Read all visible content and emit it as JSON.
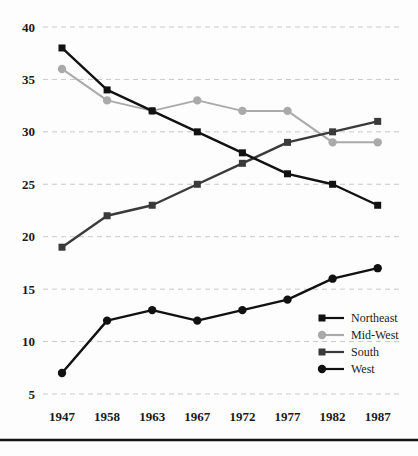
{
  "chart_data": {
    "type": "line",
    "title": "",
    "subtitle": "",
    "xlabel": "",
    "ylabel": "",
    "categories": [
      "1947",
      "1958",
      "1963",
      "1967",
      "1972",
      "1977",
      "1982",
      "1987"
    ],
    "ylim": [
      5,
      40
    ],
    "ytick_labels": [
      "5",
      "10",
      "15",
      "20",
      "25",
      "30",
      "35",
      "40"
    ],
    "ytick_values": [
      5,
      10,
      15,
      20,
      25,
      30,
      35,
      40
    ],
    "grid": "horizontal-dashed",
    "legend_position": "bottom-right-inside",
    "series": [
      {
        "name": "Northeast",
        "color": "#111111",
        "marker": "square",
        "values": [
          38,
          34,
          32,
          30,
          28,
          26,
          25,
          23
        ]
      },
      {
        "name": "Mid-West",
        "color": "#aaaaaa",
        "marker": "circle",
        "values": [
          36,
          33,
          32,
          33,
          32,
          32,
          29,
          29
        ]
      },
      {
        "name": "South",
        "color": "#3a3a3a",
        "marker": "square",
        "values": [
          19,
          22,
          23,
          25,
          27,
          29,
          30,
          31
        ]
      },
      {
        "name": "West",
        "color": "#111111",
        "marker": "circle",
        "values": [
          7,
          12,
          13,
          12,
          13,
          14,
          16,
          17
        ]
      }
    ]
  },
  "legend": {
    "entries": [
      {
        "label": "Northeast"
      },
      {
        "label": "Mid-West"
      },
      {
        "label": "South"
      },
      {
        "label": "West"
      }
    ]
  }
}
